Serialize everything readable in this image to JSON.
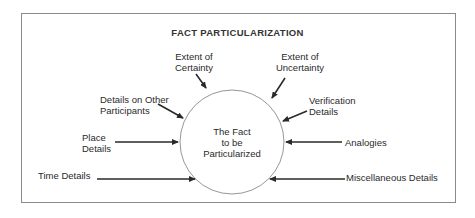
{
  "title": "FACT PARTICULARIZATION",
  "center": {
    "line1": "The Fact",
    "line2": "to be",
    "line3": "Particularized"
  },
  "inputs": [
    {
      "line1": "Extent of",
      "line2": "Certainty"
    },
    {
      "line1": "Extent of",
      "line2": "Uncertainty"
    },
    {
      "line1": "Details on Other",
      "line2": "Participants"
    },
    {
      "line1": "Verification",
      "line2": "Details"
    },
    {
      "line1": "Place",
      "line2": "Details"
    },
    {
      "line1": "Analogies"
    },
    {
      "line1": "Time Details"
    },
    {
      "line1": "Miscellaneous Details"
    }
  ],
  "colors": {
    "border": "#8a8a8a",
    "arrow": "#2a2a2a",
    "circle": "#8a8a8a",
    "text": "#2a2a2a"
  }
}
